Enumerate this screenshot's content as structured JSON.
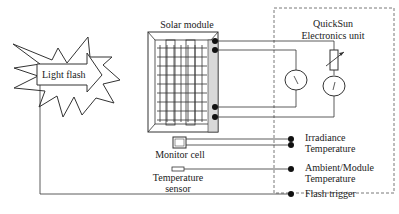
{
  "diagram": {
    "light_flash": {
      "label": "Light flash"
    },
    "solar_module": {
      "label": "Solar module"
    },
    "electronics_unit": {
      "label_line1": "QuickSun",
      "label_line2": "Electronics unit"
    },
    "monitor_cell": {
      "label": "Monitor cell"
    },
    "temperature_sensor": {
      "label_line1": "Temperature",
      "label_line2": "sensor"
    },
    "terminals": {
      "irradiance": "Irradiance",
      "temperature": "Temperature",
      "ambient_module_line1": "Ambient/Module",
      "ambient_module_line2": "Temperature",
      "flash_trigger": "Flash trigger"
    },
    "meters": {
      "voltmeter": "V",
      "ammeter": "I"
    }
  }
}
